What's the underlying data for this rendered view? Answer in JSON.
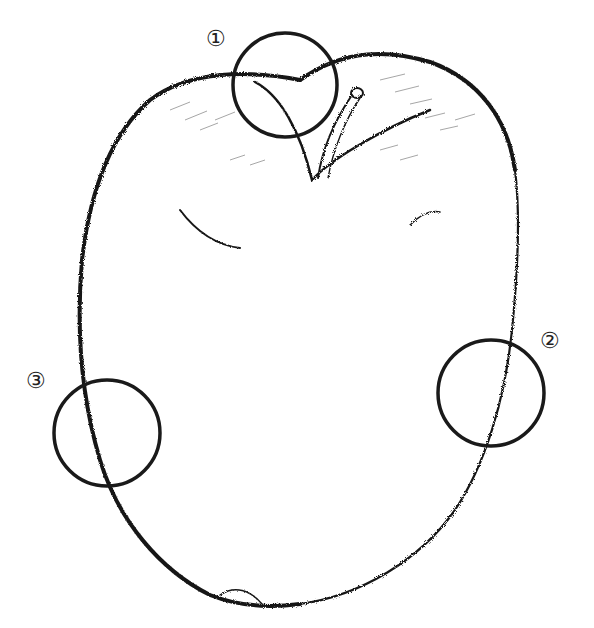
{
  "figure": {
    "stroke_color": "#111111",
    "background": "#ffffff"
  },
  "markers": [
    {
      "id": 1,
      "label": "①",
      "cx": 285,
      "cy": 85,
      "r": 52
    },
    {
      "id": 2,
      "label": "②",
      "cx": 491,
      "cy": 393,
      "r": 53
    },
    {
      "id": 3,
      "label": "③",
      "cx": 107,
      "cy": 433,
      "r": 53
    }
  ]
}
